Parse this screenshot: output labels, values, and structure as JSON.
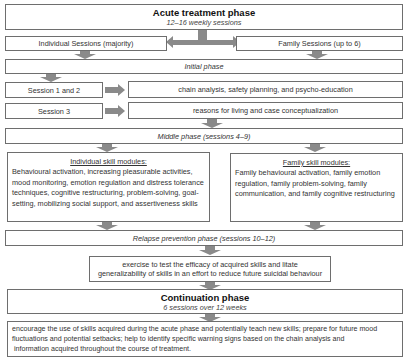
{
  "acute": {
    "title": "Acute treatment phase",
    "subtitle": "12–16 weekly sessions"
  },
  "sessions": {
    "individual": "Individual Sessions (majority)",
    "family": "Family Sessions (up to 6)"
  },
  "initial": {
    "label": "Initial phase",
    "rows": [
      {
        "session": "Session 1 and 2",
        "content": "chain analysis, safety planning, and psycho-education"
      },
      {
        "session": "Session 3",
        "content": "reasons for living and case conceptualization"
      }
    ]
  },
  "middle": {
    "label": "Middle phase (sessions 4–9)",
    "individual_modules": {
      "heading": "Individual skill modules:",
      "text": "Behavioural activation, increasing pleasurable activities, mood monitoring, emotion regulation and distress tolerance techniques, cognitive restructuring, problem-solving, goal-setting, mobilizing social support, and assertiveness skills"
    },
    "family_modules": {
      "heading": "Family skill modules:",
      "text": "Family behavioural activation, family emotion regulation, family problem-solving, family communication, and family cognitive restructuring"
    }
  },
  "relapse": {
    "label": "Relapse prevention phase (sessions 10–12)",
    "content_line1": "exercise to test the efficacy of acquired skills and litate",
    "content_line2": "generalizability of skills in an effort to reduce future suicidal behaviour"
  },
  "continuation": {
    "title": "Continuation phase",
    "subtitle": "6 sessions over 12 weeks",
    "content_line1": "encourage the use of skills acquired during the acute phase and potentially teach new skills; prepare for future mood",
    "content_line2": "fluctuations and potential setbacks; help to identify specific warning signs based on the chain analysis and",
    "content_line3": " information acquired throughout the course of treatment."
  },
  "colors": {
    "border": "#6e6e6e",
    "arrow": "#8a8a8a"
  }
}
